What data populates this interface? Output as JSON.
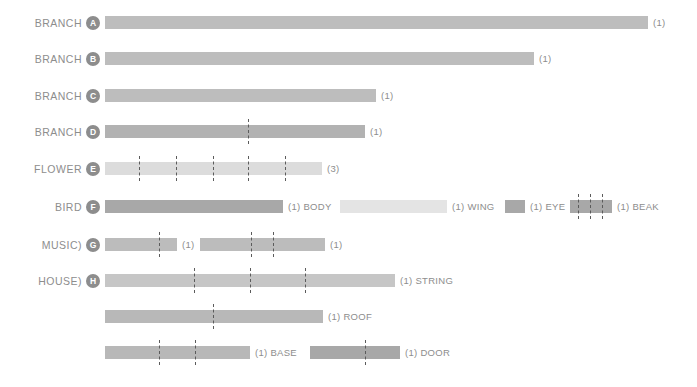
{
  "chart_data": {
    "type": "bar",
    "title": "",
    "subtitle": "",
    "xlabel": "",
    "ylabel": "",
    "grid": false,
    "legend": "none",
    "orientation": "horizontal",
    "x_axis_range_px": [
      105,
      660
    ],
    "rows": [
      {
        "label": "BRANCH",
        "badge": "A",
        "row_top": 8,
        "segments": [
          {
            "name": "",
            "count_label": "(1)",
            "start": 105,
            "end": 648,
            "shade": "#bdbdbd",
            "dashes": []
          }
        ]
      },
      {
        "label": "BRANCH",
        "badge": "B",
        "row_top": 44,
        "segments": [
          {
            "name": "",
            "count_label": "(1)",
            "start": 105,
            "end": 534,
            "shade": "#bdbdbd",
            "dashes": []
          }
        ]
      },
      {
        "label": "BRANCH",
        "badge": "C",
        "row_top": 81,
        "segments": [
          {
            "name": "",
            "count_label": "(1)",
            "start": 105,
            "end": 376,
            "shade": "#bdbdbd",
            "dashes": []
          }
        ]
      },
      {
        "label": "BRANCH",
        "badge": "D",
        "row_top": 117,
        "segments": [
          {
            "name": "",
            "count_label": "(1)",
            "start": 105,
            "end": 365,
            "shade": "#b2b2b2",
            "dashes": [
              248
            ]
          }
        ]
      },
      {
        "label": "FLOWER",
        "badge": "E",
        "row_top": 154,
        "segments": [
          {
            "name": "",
            "count_label": "(3)",
            "start": 105,
            "end": 322,
            "shade": "#dcdcdc",
            "dashes": [
              139,
              176,
              213,
              248,
              285
            ]
          }
        ]
      },
      {
        "label": "BIRD",
        "badge": "F",
        "row_top": 192,
        "segments": [
          {
            "name": "BODY",
            "count_label": "(1)",
            "start": 105,
            "end": 283,
            "shade": "#a8a8a8",
            "dashes": []
          },
          {
            "name": "WING",
            "count_label": "(1)",
            "start": 340,
            "end": 447,
            "shade": "#e4e4e4",
            "dashes": []
          },
          {
            "name": "EYE",
            "count_label": "(1)",
            "start": 505,
            "end": 525,
            "shade": "#a8a8a8",
            "dashes": []
          },
          {
            "name": "BEAK",
            "count_label": "(1)",
            "start": 570,
            "end": 612,
            "shade": "#a8a8a8",
            "dashes": [
              578,
              590,
              602
            ]
          }
        ]
      },
      {
        "label": "MUSIC)",
        "badge": "G",
        "row_top": 230,
        "segments": [
          {
            "name": "",
            "count_label": "(1)",
            "start": 105,
            "end": 177,
            "shade": "#bcbcbc",
            "dashes": [
              159
            ]
          },
          {
            "name": "",
            "count_label": "(1)",
            "start": 200,
            "end": 325,
            "shade": "#bcbcbc",
            "dashes": [
              251,
              273
            ]
          }
        ]
      },
      {
        "label": "HOUSE)",
        "badge": "H",
        "row_top": 266,
        "segments": [
          {
            "name": "STRING",
            "count_label": "(1)",
            "start": 105,
            "end": 395,
            "shade": "#c6c6c6",
            "dashes": [
              194,
              250,
              305
            ]
          }
        ]
      },
      {
        "label": "",
        "badge": "",
        "row_top": 302,
        "segments": [
          {
            "name": "ROOF",
            "count_label": "(1)",
            "start": 105,
            "end": 323,
            "shade": "#b8b8b8",
            "dashes": [
              213
            ]
          }
        ]
      },
      {
        "label": "",
        "badge": "",
        "row_top": 338,
        "segments": [
          {
            "name": "BASE",
            "count_label": "(1)",
            "start": 105,
            "end": 250,
            "shade": "#b8b8b8",
            "dashes": [
              159,
              195
            ]
          },
          {
            "name": "DOOR",
            "count_label": "(1)",
            "start": 310,
            "end": 400,
            "shade": "#a8a8a8",
            "dashes": [
              365
            ]
          }
        ]
      }
    ],
    "colors": {
      "text": "#8d8d8d",
      "badge_fill": "#8d8d8d",
      "badge_text": "#ffffff",
      "dash_line": "#5b5b5b",
      "background": "#ffffff"
    }
  }
}
